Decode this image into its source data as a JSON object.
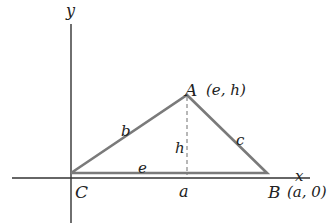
{
  "diagram": {
    "type": "geometry-triangle-coordinate",
    "axes": {
      "x_label": "x",
      "y_label": "y"
    },
    "vertices": {
      "A": {
        "label": "A",
        "coords": "(e, h)"
      },
      "B": {
        "label": "B",
        "coords": "(a, 0)"
      },
      "C": {
        "label": "C",
        "coords": ""
      }
    },
    "sides": {
      "b": "b",
      "c": "c",
      "e": "e",
      "h": "h",
      "a": "a"
    },
    "colors": {
      "triangle": "#7a7a7a",
      "axes": "#333333",
      "altitude": "#888888",
      "text": "#222222"
    }
  }
}
